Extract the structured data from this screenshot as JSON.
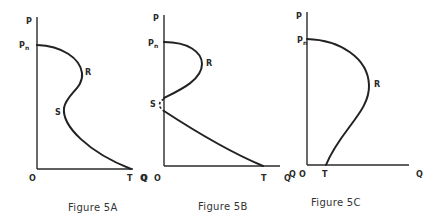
{
  "figures": [
    {
      "id": "5A",
      "caption": "Figure 5A",
      "labels": {
        "y_axis": "P",
        "x_axis": "Q",
        "origin": "O",
        "pn_main": "P",
        "pn_sub": "n",
        "r": "R",
        "s": "S",
        "t": "T"
      },
      "description": "Backward-bending S-shaped curve: starts at Pn on P-axis, bulges right to R, bends back left to S, then slopes down to T on Q-axis"
    },
    {
      "id": "5B",
      "caption": "Figure 5B",
      "labels": {
        "y_axis": "P",
        "x_axis": "Q",
        "origin": "O",
        "pn_main": "P",
        "pn_sub": "n",
        "r": "R",
        "s": "S",
        "t": "T",
        "stray_left": "Q"
      },
      "description": "Curve from Pn bulges right to R and returns to the P-axis; dashed gap at S; separate lower curve from P-axis down to T on Q-axis"
    },
    {
      "id": "5C",
      "caption": "Figure 5C",
      "labels": {
        "y_axis": "P",
        "x_axis": "Q",
        "origin": "O",
        "pn_main": "P",
        "pn_sub": "n",
        "r": "R",
        "t": "T",
        "stray_left": "Q"
      },
      "description": "Curve from Pn bulges right to R, then slopes down-left to T on Q-axis near origin"
    }
  ],
  "colors": {
    "ink": "#222222",
    "background": "#ffffff"
  }
}
